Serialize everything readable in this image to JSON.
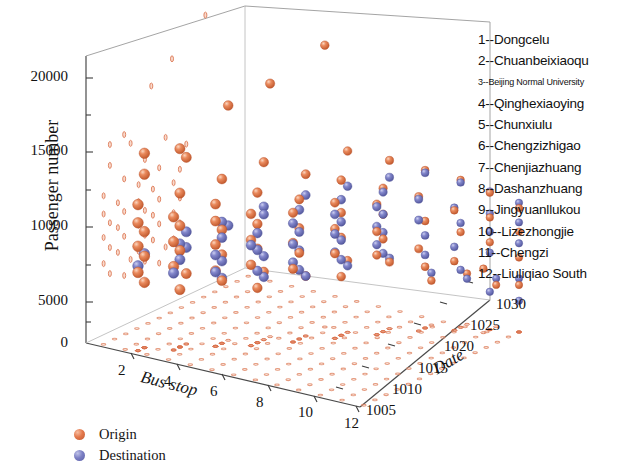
{
  "figure": {
    "background": "#ffffff",
    "type": "3d-scatter"
  },
  "axes": {
    "y": {
      "label": "Passenger number",
      "ticks": [
        "0",
        "5000",
        "10000",
        "15000",
        "20000"
      ]
    },
    "x": {
      "label": "Bus stop",
      "ticks": [
        "2",
        "4",
        "6",
        "8",
        "10",
        "12"
      ]
    },
    "z": {
      "label": "Date",
      "ticks": [
        "1005",
        "1010",
        "1015",
        "1020",
        "1025",
        "1030"
      ]
    }
  },
  "series_legend": {
    "items": [
      {
        "label": "Origin",
        "color": "#e4794c",
        "marker": "sphere"
      },
      {
        "label": "Destination",
        "color": "#7b7fc4",
        "marker": "sphere"
      }
    ]
  },
  "station_legend": {
    "items": [
      "1--Dongcelu",
      "2--Chuanbeixiaoqu",
      "3--Beijing Normal University",
      "4--Qinghexiaoying",
      "5--Chunxiulu",
      "6--Chengzizhigao",
      "7--Chenjiazhuang",
      "8--Dashanzhuang",
      "9--Jingyuanllukou",
      "10--Lizezhongjie",
      "11--Chengzi",
      "12--Liuliqiao South"
    ]
  },
  "chart_data": {
    "type": "scatter",
    "title": "",
    "xlabel": "Bus stop",
    "ylabel": "Passenger number",
    "zlabel": "Date",
    "xlim": [
      0,
      12
    ],
    "ylim": [
      0,
      22000
    ],
    "zlim": [
      1005,
      1030
    ],
    "xticks": [
      2,
      4,
      6,
      8,
      10,
      12
    ],
    "yticks": [
      0,
      5000,
      10000,
      15000,
      20000
    ],
    "zticks": [
      1005,
      1010,
      1015,
      1020,
      1025,
      1030
    ],
    "grid": false,
    "legend_position": "bottom-left",
    "projections": {
      "floor": true,
      "back_wall": true,
      "note": "Small flattened orange marks are projections of the Origin points onto the floor (y=0) and onto the back wall planes."
    },
    "series": [
      {
        "name": "Origin",
        "color": "#e4794c",
        "points": [
          [
            6,
            21600,
            1021
          ],
          [
            5,
            19400,
            1016
          ],
          [
            4,
            18000,
            1013
          ],
          [
            3,
            15200,
            1009
          ],
          [
            2,
            14900,
            1007
          ],
          [
            3,
            14300,
            1010
          ],
          [
            2,
            13300,
            1007
          ],
          [
            5,
            13600,
            1015
          ],
          [
            7,
            13900,
            1021
          ],
          [
            4,
            12600,
            1012
          ],
          [
            6,
            12400,
            1018
          ],
          [
            8,
            12900,
            1024
          ],
          [
            3,
            11800,
            1009
          ],
          [
            5,
            11500,
            1014
          ],
          [
            2,
            11200,
            1006
          ],
          [
            7,
            11900,
            1020
          ],
          [
            9,
            12100,
            1026
          ],
          [
            4,
            10900,
            1011
          ],
          [
            6,
            10700,
            1017
          ],
          [
            8,
            11000,
            1023
          ],
          [
            10,
            11300,
            1028
          ],
          [
            3,
            10200,
            1008
          ],
          [
            5,
            10100,
            1013
          ],
          [
            7,
            10400,
            1019
          ],
          [
            2,
            9800,
            1006
          ],
          [
            4,
            9600,
            1011
          ],
          [
            6,
            9900,
            1016
          ],
          [
            8,
            10000,
            1022
          ],
          [
            9,
            10300,
            1025
          ],
          [
            11,
            10500,
            1029
          ],
          [
            3,
            9300,
            1009
          ],
          [
            5,
            9100,
            1014
          ],
          [
            7,
            9400,
            1020
          ],
          [
            2,
            8900,
            1007
          ],
          [
            4,
            8700,
            1012
          ],
          [
            6,
            8500,
            1017
          ],
          [
            8,
            9000,
            1023
          ],
          [
            10,
            9200,
            1027
          ],
          [
            12,
            9500,
            1030
          ],
          [
            3,
            8300,
            1008
          ],
          [
            5,
            8100,
            1013
          ],
          [
            7,
            8400,
            1019
          ],
          [
            2,
            8000,
            1006
          ],
          [
            4,
            7800,
            1011
          ],
          [
            6,
            7600,
            1016
          ],
          [
            8,
            7900,
            1022
          ],
          [
            9,
            8200,
            1026
          ],
          [
            11,
            8600,
            1029
          ],
          [
            3,
            7400,
            1009
          ],
          [
            5,
            7200,
            1014
          ],
          [
            7,
            7500,
            1020
          ],
          [
            2,
            7000,
            1007
          ],
          [
            4,
            6800,
            1012
          ],
          [
            6,
            6600,
            1017
          ],
          [
            8,
            7100,
            1023
          ],
          [
            10,
            7300,
            1028
          ],
          [
            12,
            7700,
            1030
          ],
          [
            3,
            6400,
            1008
          ],
          [
            5,
            6200,
            1013
          ],
          [
            7,
            6500,
            1019
          ],
          [
            2,
            6000,
            1006
          ],
          [
            4,
            5800,
            1011
          ],
          [
            6,
            5600,
            1016
          ],
          [
            8,
            6100,
            1022
          ],
          [
            9,
            6300,
            1025
          ],
          [
            11,
            6700,
            1029
          ],
          [
            3,
            5400,
            1010
          ],
          [
            5,
            5200,
            1015
          ],
          [
            7,
            5500,
            1021
          ],
          [
            2,
            5000,
            1007
          ],
          [
            4,
            4800,
            1012
          ],
          [
            6,
            4600,
            1018
          ],
          [
            8,
            5100,
            1024
          ],
          [
            10,
            5300,
            1027
          ],
          [
            12,
            5700,
            1030
          ],
          [
            3,
            4400,
            1009
          ],
          [
            5,
            4200,
            1014
          ],
          [
            7,
            4500,
            1020
          ],
          [
            9,
            4700,
            1026
          ],
          [
            11,
            4900,
            1028
          ],
          [
            10,
            3900,
            1029
          ],
          [
            12,
            3600,
            1030
          ],
          [
            11,
            3200,
            1030
          ],
          [
            9,
            3400,
            1027
          ]
        ]
      },
      {
        "name": "Destination",
        "color": "#7b7fc4",
        "points": [
          [
            6,
            10800,
            1018
          ],
          [
            7,
            11200,
            1021
          ],
          [
            8,
            11600,
            1024
          ],
          [
            5,
            10200,
            1015
          ],
          [
            9,
            11900,
            1026
          ],
          [
            6,
            9900,
            1017
          ],
          [
            7,
            10400,
            1020
          ],
          [
            8,
            10700,
            1023
          ],
          [
            10,
            11100,
            1028
          ],
          [
            4,
            9300,
            1012
          ],
          [
            5,
            9600,
            1015
          ],
          [
            6,
            9100,
            1016
          ],
          [
            7,
            9500,
            1019
          ],
          [
            8,
            9800,
            1022
          ],
          [
            9,
            10100,
            1025
          ],
          [
            11,
            10600,
            1029
          ],
          [
            3,
            8600,
            1010
          ],
          [
            4,
            8800,
            1013
          ],
          [
            5,
            8400,
            1014
          ],
          [
            6,
            8200,
            1017
          ],
          [
            7,
            8700,
            1020
          ],
          [
            8,
            9000,
            1023
          ],
          [
            10,
            9400,
            1027
          ],
          [
            12,
            9900,
            1030
          ],
          [
            3,
            7900,
            1009
          ],
          [
            4,
            8100,
            1012
          ],
          [
            5,
            7700,
            1013
          ],
          [
            6,
            7500,
            1016
          ],
          [
            7,
            8000,
            1019
          ],
          [
            8,
            8300,
            1022
          ],
          [
            9,
            8500,
            1025
          ],
          [
            11,
            8900,
            1029
          ],
          [
            2,
            7200,
            1007
          ],
          [
            3,
            7400,
            1010
          ],
          [
            4,
            7000,
            1011
          ],
          [
            5,
            7100,
            1014
          ],
          [
            6,
            6800,
            1017
          ],
          [
            7,
            7300,
            1020
          ],
          [
            8,
            7600,
            1023
          ],
          [
            10,
            8000,
            1028
          ],
          [
            12,
            8400,
            1030
          ],
          [
            2,
            6500,
            1006
          ],
          [
            3,
            6700,
            1009
          ],
          [
            4,
            6300,
            1012
          ],
          [
            5,
            6400,
            1015
          ],
          [
            6,
            6100,
            1016
          ],
          [
            7,
            6600,
            1019
          ],
          [
            8,
            6900,
            1022
          ],
          [
            9,
            7100,
            1026
          ],
          [
            11,
            7500,
            1029
          ],
          [
            3,
            5900,
            1008
          ],
          [
            4,
            5700,
            1011
          ],
          [
            5,
            5500,
            1014
          ],
          [
            6,
            5300,
            1017
          ],
          [
            7,
            5800,
            1020
          ],
          [
            8,
            6000,
            1023
          ],
          [
            10,
            6400,
            1027
          ],
          [
            12,
            6800,
            1030
          ],
          [
            4,
            5000,
            1012
          ],
          [
            5,
            4800,
            1015
          ],
          [
            6,
            4600,
            1018
          ],
          [
            7,
            5100,
            1021
          ],
          [
            8,
            5400,
            1024
          ],
          [
            9,
            5600,
            1026
          ],
          [
            11,
            5900,
            1029
          ],
          [
            10,
            4400,
            1028
          ],
          [
            12,
            4100,
            1030
          ],
          [
            11,
            3700,
            1030
          ],
          [
            12,
            2400,
            1030
          ],
          [
            11,
            2900,
            1029
          ],
          [
            9,
            4000,
            1027
          ],
          [
            10,
            3500,
            1029
          ]
        ]
      }
    ]
  }
}
